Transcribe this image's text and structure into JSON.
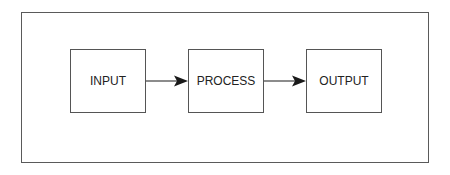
{
  "diagram": {
    "type": "flowchart",
    "direction": "left-to-right",
    "nodes": [
      {
        "id": "input",
        "label": "INPUT"
      },
      {
        "id": "process",
        "label": "PROCESS"
      },
      {
        "id": "output",
        "label": "OUTPUT"
      }
    ],
    "edges": [
      {
        "from": "input",
        "to": "process"
      },
      {
        "from": "process",
        "to": "output"
      }
    ],
    "colors": {
      "stroke": "#555555",
      "text": "#222222",
      "arrow": "#1a1a1a",
      "background": "#ffffff"
    }
  }
}
